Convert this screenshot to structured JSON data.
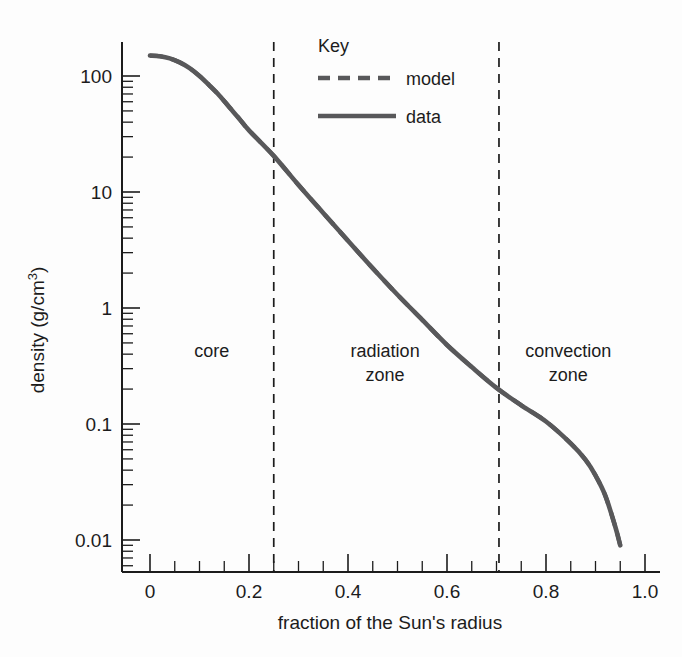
{
  "chart_data": {
    "type": "line",
    "title": "",
    "xlabel": "fraction of the Sun's radius",
    "ylabel": "density (g/cm",
    "ylabel_sup": "3",
    "ylabel_tail": ")",
    "xlim": [
      0,
      1.0
    ],
    "ylim": [
      0.008,
      200
    ],
    "yscale": "log",
    "xscale": "linear",
    "grid": false,
    "xticks": [
      "0",
      "0.2",
      "0.4",
      "0.6",
      "0.8",
      "1.0"
    ],
    "xtick_values": [
      0,
      0.2,
      0.4,
      0.6,
      0.8,
      1.0
    ],
    "xminor_step": 0.05,
    "yticks": [
      "100",
      "10",
      "1",
      "0.1",
      "0.01"
    ],
    "ytick_values": [
      100,
      10,
      1,
      0.1,
      0.01
    ],
    "legend": {
      "title": "Key",
      "position": "top-right-inside",
      "entries": [
        {
          "label": "model",
          "style": "dashed",
          "color": "#58585a"
        },
        {
          "label": "data",
          "style": "solid",
          "color": "#58585a"
        }
      ]
    },
    "annotations": [
      {
        "label": "core",
        "x": 0.125,
        "y": 0.38
      },
      {
        "label": "radiation",
        "label2": "zone",
        "x": 0.475,
        "y": 0.38
      },
      {
        "label": "convection",
        "label2": "zone",
        "x": 0.845,
        "y": 0.38
      }
    ],
    "zone_dividers": [
      {
        "x": 0.25,
        "style": "dashed"
      },
      {
        "x": 0.705,
        "style": "dashed"
      }
    ],
    "series": [
      {
        "name": "data",
        "style": "solid",
        "x": [
          0.0,
          0.02,
          0.04,
          0.06,
          0.08,
          0.1,
          0.12,
          0.14,
          0.16,
          0.18,
          0.2,
          0.25,
          0.3,
          0.35,
          0.4,
          0.45,
          0.5,
          0.55,
          0.6,
          0.65,
          0.7,
          0.75,
          0.8,
          0.85,
          0.88,
          0.9,
          0.92,
          0.94,
          0.95
        ],
        "y": [
          150,
          148,
          142,
          131,
          117,
          100,
          83,
          68,
          54,
          43,
          34,
          20.5,
          11.5,
          6.6,
          3.8,
          2.2,
          1.3,
          0.79,
          0.48,
          0.31,
          0.205,
          0.145,
          0.105,
          0.068,
          0.049,
          0.036,
          0.024,
          0.013,
          0.009
        ]
      },
      {
        "name": "model",
        "style": "dashed",
        "x": [
          0.0,
          0.02,
          0.04,
          0.06,
          0.08,
          0.1,
          0.12,
          0.14,
          0.16,
          0.18,
          0.2,
          0.25,
          0.3,
          0.35,
          0.4,
          0.45,
          0.5,
          0.55,
          0.6,
          0.65,
          0.7,
          0.75,
          0.8,
          0.85,
          0.88,
          0.9,
          0.92,
          0.94,
          0.95
        ],
        "y": [
          150,
          148,
          142,
          131,
          117,
          100,
          83,
          68,
          54,
          43,
          34,
          20.5,
          11.5,
          6.6,
          3.8,
          2.2,
          1.3,
          0.79,
          0.48,
          0.31,
          0.205,
          0.145,
          0.105,
          0.068,
          0.049,
          0.036,
          0.024,
          0.013,
          0.009
        ]
      }
    ]
  }
}
